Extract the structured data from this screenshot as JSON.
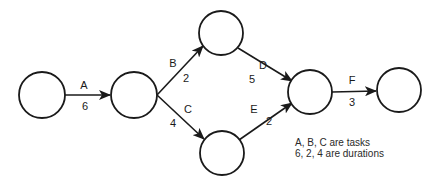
{
  "diagram": {
    "type": "activity-on-arrow network",
    "nodes": [
      {
        "id": "n1",
        "cx": 42,
        "cy": 95,
        "r": 23
      },
      {
        "id": "n2",
        "cx": 134,
        "cy": 95,
        "r": 23
      },
      {
        "id": "n3",
        "cx": 221,
        "cy": 33,
        "r": 22
      },
      {
        "id": "n4",
        "cx": 222,
        "cy": 153,
        "r": 22
      },
      {
        "id": "n5",
        "cx": 310,
        "cy": 92,
        "r": 22
      },
      {
        "id": "n6",
        "cx": 399,
        "cy": 90,
        "r": 22
      }
    ],
    "edges": [
      {
        "task": "A",
        "duration": "6",
        "from": "n1",
        "to": "n2"
      },
      {
        "task": "B",
        "duration": "2",
        "from": "n2",
        "to": "n3"
      },
      {
        "task": "C",
        "duration": "4",
        "from": "n2",
        "to": "n4"
      },
      {
        "task": "D",
        "duration": "5",
        "from": "n3",
        "to": "n5"
      },
      {
        "task": "E",
        "duration": "2",
        "from": "n4",
        "to": "n5"
      },
      {
        "task": "F",
        "duration": "3",
        "from": "n5",
        "to": "n6"
      }
    ],
    "legend": {
      "line1": "A, B, C are tasks",
      "line2": "6, 2, 4 are durations"
    },
    "colors": {
      "stroke": "#1a1a1a",
      "background": "#ffffff"
    }
  }
}
